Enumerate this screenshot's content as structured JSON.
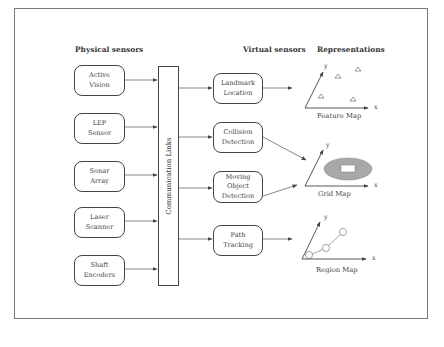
{
  "headers": {
    "physical": "Physical sensors",
    "virtual": "Virtual sensors",
    "representations": "Representations"
  },
  "physical_sensors": [
    {
      "label": "Active\nVision"
    },
    {
      "label": "LEP\nSensor"
    },
    {
      "label": "Sonar\nArray"
    },
    {
      "label": "Laser\nScanner"
    },
    {
      "label": "Shaft\nEncoders"
    }
  ],
  "communication_bar": {
    "label": "Communication Links"
  },
  "virtual_sensors": [
    {
      "label": "Landmark\nLocation"
    },
    {
      "label": "Collision\nDetection"
    },
    {
      "label": "Moving\nObject\nDetection"
    },
    {
      "label": "Path\nTracking"
    }
  ],
  "representations": [
    {
      "label": "Feature Map",
      "x_axis": "x",
      "y_axis": "y",
      "icon": "triangle-landmarks"
    },
    {
      "label": "Grid Map",
      "x_axis": "x",
      "y_axis": "y",
      "icon": "ellipse-grid"
    },
    {
      "label": "Region Map",
      "x_axis": "x",
      "y_axis": "y",
      "icon": "circle-path"
    }
  ],
  "colors": {
    "stroke": "#444444",
    "frame": "#7a7a7a",
    "grid_fill": "#a8a8a8",
    "grid_inner": "#ffffff"
  }
}
